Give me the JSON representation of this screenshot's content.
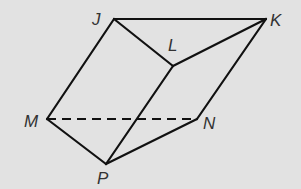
{
  "diagram": {
    "type": "prism",
    "colors": {
      "background": "#e2e2e2",
      "line": "#111111",
      "label": "#333333"
    },
    "vertices": {
      "J": {
        "label": "J",
        "x": 114,
        "y": 19
      },
      "K": {
        "label": "K",
        "x": 266,
        "y": 19
      },
      "L": {
        "label": "L",
        "x": 173,
        "y": 66
      },
      "M": {
        "label": "M",
        "x": 47,
        "y": 119
      },
      "N": {
        "label": "N",
        "x": 197,
        "y": 119
      },
      "P": {
        "label": "P",
        "x": 106,
        "y": 164
      }
    },
    "edges": [
      {
        "from": "J",
        "to": "K",
        "style": "solid"
      },
      {
        "from": "J",
        "to": "L",
        "style": "solid"
      },
      {
        "from": "L",
        "to": "K",
        "style": "solid"
      },
      {
        "from": "J",
        "to": "M",
        "style": "solid"
      },
      {
        "from": "L",
        "to": "P",
        "style": "solid"
      },
      {
        "from": "K",
        "to": "N",
        "style": "solid"
      },
      {
        "from": "M",
        "to": "P",
        "style": "solid"
      },
      {
        "from": "P",
        "to": "N",
        "style": "solid"
      },
      {
        "from": "M",
        "to": "N",
        "style": "dashed"
      }
    ]
  }
}
